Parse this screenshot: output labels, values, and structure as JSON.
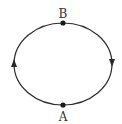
{
  "diagram": {
    "type": "closed-loop-orbit",
    "shape": "ellipse",
    "direction": "clockwise",
    "colors": {
      "stroke": "#2a2a2a",
      "point": "#1a1a1a",
      "label": "#333333",
      "background": "#ffffff"
    },
    "ellipse": {
      "cx": 63,
      "cy": 64,
      "rx": 49,
      "ry": 41
    },
    "points": [
      {
        "id": "B",
        "label": "B",
        "position": "top"
      },
      {
        "id": "A",
        "label": "A",
        "position": "bottom"
      }
    ],
    "arrows": [
      {
        "side": "left",
        "direction": "up"
      },
      {
        "side": "right",
        "direction": "down"
      }
    ]
  }
}
